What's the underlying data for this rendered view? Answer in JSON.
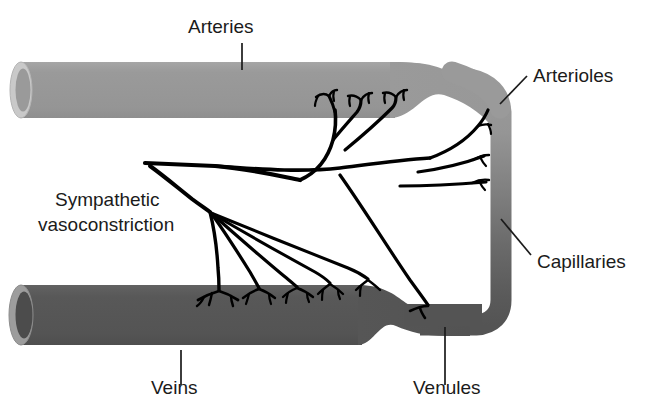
{
  "figure": {
    "type": "anatomical-diagram",
    "background_color": "#ffffff"
  },
  "colors": {
    "artery_fill": "#9a9a9a",
    "artery_lumen_ring": "#c9c9c9",
    "artery_lumen_inner": "#9a9a9a",
    "vein_fill": "#585858",
    "vein_lumen_ring": "#9d9d9d",
    "vein_lumen_inner": "#4c4c4c",
    "capillary_mid": "#737373",
    "nerve": "#000000",
    "text": "#1b1b1b",
    "leader_line": "#1b1b1b"
  },
  "labels": {
    "arteries": {
      "text": "Arteries",
      "x": 188,
      "y": 33,
      "anchor": "start",
      "leader": {
        "x1": 242,
        "y1": 43,
        "x2": 242,
        "y2": 70
      }
    },
    "arterioles": {
      "text": "Arterioles",
      "x": 533,
      "y": 82,
      "anchor": "start",
      "leader": {
        "x1": 527,
        "y1": 76,
        "x2": 500,
        "y2": 104
      }
    },
    "capillaries": {
      "text": "Capillaries",
      "x": 537,
      "y": 268,
      "anchor": "start",
      "leader": {
        "x1": 531,
        "y1": 255,
        "x2": 501,
        "y2": 219
      }
    },
    "venules": {
      "text": "Venules",
      "x": 413,
      "y": 394,
      "anchor": "start",
      "leader": {
        "x1": 445,
        "y1": 385,
        "x2": 445,
        "y2": 327
      }
    },
    "veins": {
      "text": "Veins",
      "x": 151,
      "y": 394,
      "anchor": "start",
      "leader": {
        "x1": 181,
        "y1": 385,
        "x2": 181,
        "y2": 350
      }
    },
    "sympathetic": {
      "line1": "Sympathetic",
      "line2": "vasoconstriction",
      "x": 55,
      "y1": 206,
      "y2": 231,
      "anchor": "start"
    }
  },
  "vessels": {
    "artery": {
      "name": "Arteries",
      "left_x": 14,
      "top_y": 62,
      "bottom_y": 118,
      "taper_start_x": 395,
      "description": "Thick light-gray tube running left to right, tapering into the arteriole"
    },
    "vein": {
      "name": "Veins",
      "left_x": 14,
      "top_y": 285,
      "bottom_y": 345,
      "taper_start_x": 360,
      "description": "Thick dark-gray tube running left to right, tapering into the venule"
    },
    "capillary_bend": {
      "name": "Capillaries",
      "x": 497,
      "top_y": 100,
      "bottom_y": 322,
      "description": "Narrow vertical segment on the right joining arteriole to venule; shades from light gray at top to dark gray at bottom"
    }
  },
  "nerve": {
    "name": "Sympathetic vasoconstriction fibers",
    "trunk_origin": {
      "x": 145,
      "y": 163
    },
    "arterial_terminal_count": 3,
    "capillary_terminal_count": 3,
    "venous_terminal_count": 5,
    "description": "A single sympathetic trunk enters from the left and divides into an upper set of fibers terminating on the artery and arteriole and a lower fan of fibers terminating on the vein and venule"
  }
}
